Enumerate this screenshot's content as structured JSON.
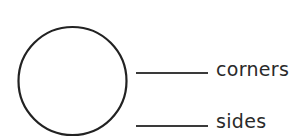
{
  "worksheet": {
    "shape": {
      "name": "circle",
      "stroke": "#222222"
    },
    "questions": [
      {
        "label": "corners",
        "answer": ""
      },
      {
        "label": "sides",
        "answer": ""
      }
    ]
  }
}
